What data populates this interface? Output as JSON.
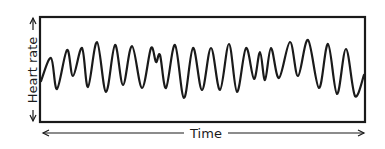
{
  "chart_data": {
    "type": "line",
    "title": "",
    "xlabel": "Time",
    "ylabel": "Heart rate",
    "axis_style": "hand-drawn arrows, no ticks, no numeric values",
    "grid": false,
    "legend": null,
    "frame": true,
    "series": [
      {
        "name": "Heart rate",
        "color": "#1a1a1a",
        "points_px": [
          [
            41,
            81
          ],
          [
            51,
            58
          ],
          [
            57,
            89
          ],
          [
            67,
            50
          ],
          [
            73,
            76
          ],
          [
            82,
            48
          ],
          [
            88,
            87
          ],
          [
            97,
            42
          ],
          [
            106,
            92
          ],
          [
            115,
            45
          ],
          [
            123,
            85
          ],
          [
            132,
            46
          ],
          [
            142,
            88
          ],
          [
            151,
            48
          ],
          [
            156,
            62
          ],
          [
            160,
            55
          ],
          [
            166,
            88
          ],
          [
            175,
            45
          ],
          [
            184,
            98
          ],
          [
            193,
            48
          ],
          [
            202,
            90
          ],
          [
            211,
            48
          ],
          [
            220,
            90
          ],
          [
            229,
            44
          ],
          [
            237,
            92
          ],
          [
            246,
            48
          ],
          [
            254,
            79
          ],
          [
            260,
            52
          ],
          [
            265,
            80
          ],
          [
            271,
            48
          ],
          [
            279,
            78
          ],
          [
            290,
            42
          ],
          [
            298,
            76
          ],
          [
            308,
            40
          ],
          [
            319,
            88
          ],
          [
            328,
            44
          ],
          [
            337,
            94
          ],
          [
            346,
            49
          ],
          [
            355,
            96
          ],
          [
            364,
            75
          ]
        ]
      }
    ]
  },
  "labels": {
    "x_axis": "Time",
    "y_axis": "Heart rate"
  },
  "colors": {
    "ink": "#1a1a1a",
    "background": "#ffffff"
  }
}
